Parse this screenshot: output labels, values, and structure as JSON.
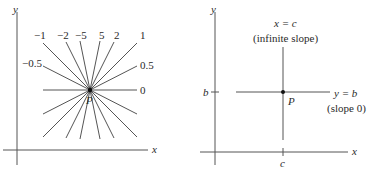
{
  "left_panel": {
    "axis_x_label": "x",
    "axis_y_label": "y",
    "point_label": "P",
    "slopes": [
      {
        "label": "-1",
        "slope": -1
      },
      {
        "label": "-2",
        "slope": -2
      },
      {
        "label": "-5",
        "slope": -5
      },
      {
        "label": "5",
        "slope": 5
      },
      {
        "label": "2",
        "slope": 2
      },
      {
        "label": "1",
        "slope": 1
      },
      {
        "label": "-0.5",
        "slope": -0.5
      },
      {
        "label": "0.5",
        "slope": 0.5
      },
      {
        "label": "0",
        "slope": 0
      }
    ]
  },
  "right_panel": {
    "axis_x_label": "x",
    "axis_y_label": "y",
    "point_label": "P",
    "vertical_line_label": "x = c",
    "vertical_line_note": "(infinite slope)",
    "horizontal_line_label": "y = b",
    "horizontal_line_note": "(slope 0)",
    "tick_b": "b",
    "tick_c": "c"
  },
  "colors": {
    "line": "#555555",
    "text": "#2a2a2a",
    "point": "#111111"
  }
}
